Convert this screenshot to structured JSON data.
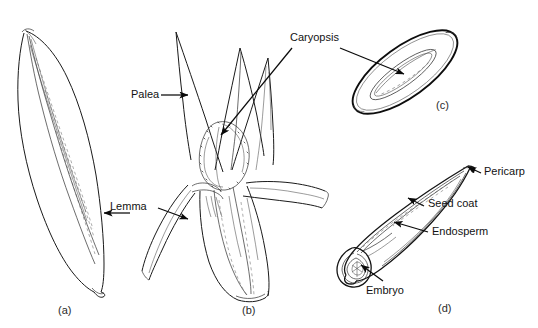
{
  "figure": {
    "background_color": "#ffffff",
    "ink_color": "#1a1a1a",
    "width": 538,
    "height": 328
  },
  "panels": [
    {
      "letter": "(a)",
      "name": "intact-spikelet",
      "description": "Intact spikelet enclosed by glumes, lanceolate, tilted"
    },
    {
      "letter": "(b)",
      "name": "opened-spikelet",
      "description": "Spikelet opened to expose the caryopsis between palea and lemma"
    },
    {
      "letter": "(c)",
      "name": "caryopsis-whole",
      "description": "Whole caryopsis (grain) viewed externally"
    },
    {
      "letter": "(d)",
      "name": "caryopsis-section",
      "description": "Longitudinal section of caryopsis showing internal tissues"
    }
  ],
  "labels": [
    {
      "name": "palea",
      "text": "Palea"
    },
    {
      "name": "lemma",
      "text": "Lemma"
    },
    {
      "name": "caryopsis",
      "text": "Caryopsis"
    },
    {
      "name": "pericarp",
      "text": "Pericarp"
    },
    {
      "name": "seed-coat",
      "text": "Seed coat"
    },
    {
      "name": "endosperm",
      "text": "Endosperm"
    },
    {
      "name": "embryo",
      "text": "Embryo"
    }
  ]
}
